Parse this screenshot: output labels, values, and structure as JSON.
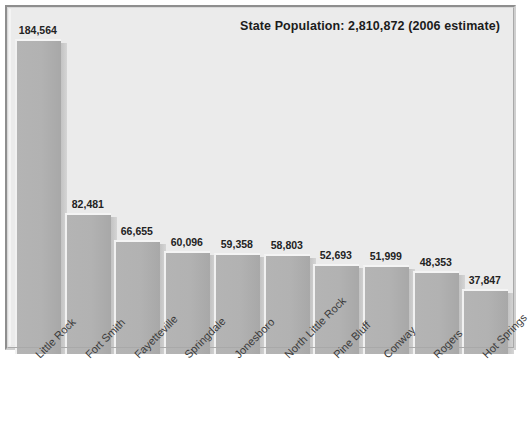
{
  "chart_data": {
    "type": "bar",
    "title": "State Population: 2,810,872 (2006 estimate)",
    "xlabel": "",
    "ylabel": "",
    "grid": false,
    "legend": "none",
    "ylim": [
      0,
      200000
    ],
    "categories": [
      "Little Rock",
      "Fort Smith",
      "Fayetteville",
      "Springdale",
      "Jonesboro",
      "North Little Rock",
      "Pine Bluff",
      "Conway",
      "Rogers",
      "Hot Springs"
    ],
    "values": [
      184564,
      82481,
      66655,
      60096,
      59358,
      58803,
      52693,
      51999,
      48353,
      37847
    ],
    "value_labels": [
      "184,564",
      "82,481",
      "66,655",
      "60,096",
      "59,358",
      "58,803",
      "52,693",
      "51,999",
      "48,353",
      "37,847"
    ],
    "colors": {
      "bar_fill": "#b2b2b2",
      "bar_highlight": "#f4f4f4",
      "bar_shadow": "#c9c9c9",
      "plot_background": "#ebebeb",
      "frame": "#8e8e8e",
      "text": "#232323"
    }
  }
}
